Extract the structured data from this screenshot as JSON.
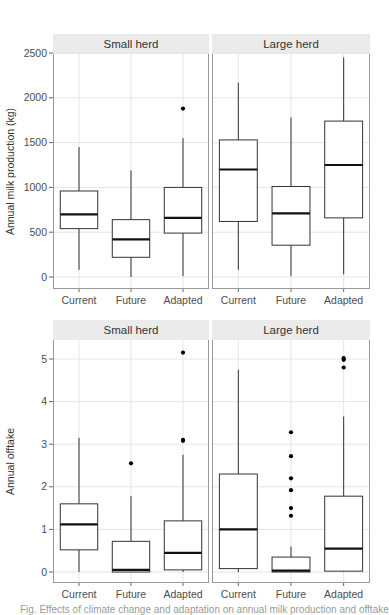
{
  "chart_data": [
    {
      "type": "box",
      "title": "",
      "ylabel": "Annual milk production (kg)",
      "xlabel": "",
      "ylim": [
        -100,
        2650
      ],
      "yticks": [
        0,
        500,
        1000,
        1500,
        2000,
        2500
      ],
      "categories": [
        "Current",
        "Future",
        "Adapted"
      ],
      "grid": true,
      "facets": [
        {
          "label": "Small herd",
          "boxes": [
            {
              "category": "Current",
              "whisker_low": 80,
              "q1": 540,
              "median": 700,
              "q3": 960,
              "whisker_high": 1450,
              "outliers": []
            },
            {
              "category": "Future",
              "whisker_low": 0,
              "q1": 220,
              "median": 420,
              "q3": 640,
              "whisker_high": 1190,
              "outliers": []
            },
            {
              "category": "Adapted",
              "whisker_low": 10,
              "q1": 490,
              "median": 660,
              "q3": 1000,
              "whisker_high": 1550,
              "outliers": [
                1880
              ]
            }
          ]
        },
        {
          "label": "Large herd",
          "boxes": [
            {
              "category": "Current",
              "whisker_low": 80,
              "q1": 620,
              "median": 1200,
              "q3": 1530,
              "whisker_high": 2170,
              "outliers": []
            },
            {
              "category": "Future",
              "whisker_low": 10,
              "q1": 355,
              "median": 710,
              "q3": 1010,
              "whisker_high": 1780,
              "outliers": []
            },
            {
              "category": "Adapted",
              "whisker_low": 30,
              "q1": 660,
              "median": 1250,
              "q3": 1740,
              "whisker_high": 2450,
              "outliers": []
            }
          ]
        }
      ]
    },
    {
      "type": "box",
      "title": "",
      "ylabel": "Annual offtake",
      "xlabel": "",
      "ylim": [
        -0.25,
        5.3
      ],
      "yticks": [
        0,
        1,
        2,
        3,
        4,
        5
      ],
      "categories": [
        "Current",
        "Future",
        "Adapted"
      ],
      "grid": true,
      "facets": [
        {
          "label": "Small herd",
          "boxes": [
            {
              "category": "Current",
              "whisker_low": 0,
              "q1": 0.52,
              "median": 1.12,
              "q3": 1.6,
              "whisker_high": 3.15,
              "outliers": []
            },
            {
              "category": "Future",
              "whisker_low": 0,
              "q1": 0.0,
              "median": 0.05,
              "q3": 0.72,
              "whisker_high": 1.78,
              "outliers": [
                2.55
              ]
            },
            {
              "category": "Adapted",
              "whisker_low": 0,
              "q1": 0.05,
              "median": 0.45,
              "q3": 1.2,
              "whisker_high": 2.75,
              "outliers": [
                3.08,
                3.1,
                5.15
              ]
            }
          ]
        },
        {
          "label": "Large herd",
          "boxes": [
            {
              "category": "Current",
              "whisker_low": 0,
              "q1": 0.08,
              "median": 1.0,
              "q3": 2.3,
              "whisker_high": 4.75,
              "outliers": []
            },
            {
              "category": "Future",
              "whisker_low": 0,
              "q1": 0.0,
              "median": 0.03,
              "q3": 0.35,
              "whisker_high": 0.6,
              "outliers": [
                1.32,
                1.5,
                1.92,
                2.2,
                2.72,
                3.28
              ]
            },
            {
              "category": "Adapted",
              "whisker_low": 0,
              "q1": 0.02,
              "median": 0.55,
              "q3": 1.78,
              "whisker_high": 3.65,
              "outliers": [
                4.8,
                4.98,
                5.02
              ]
            }
          ]
        }
      ]
    }
  ],
  "layout": {
    "panels": [
      {
        "top": 34,
        "strip_h": 20,
        "plot_top": 54,
        "plot_bottom": 289,
        "y_at_max_tick": 53,
        "y_at_zero": 277,
        "xlabel_y": 300
      },
      {
        "top": 320,
        "strip_h": 20,
        "plot_top": 340,
        "plot_bottom": 583,
        "y_at_max_tick": 359,
        "y_at_zero": 572,
        "xlabel_y": 594
      }
    ],
    "facet_x": [
      [
        53,
        209
      ],
      [
        212,
        370
      ]
    ],
    "colors": {
      "strip_bg": "#ebebeb",
      "grid": "#e5e5e5",
      "frame": "#999999",
      "box": "#333333",
      "median": "#111111",
      "point": "#000000"
    }
  },
  "caption": "Fig. Effects of climate change and adaptation on annual milk production and offtake"
}
